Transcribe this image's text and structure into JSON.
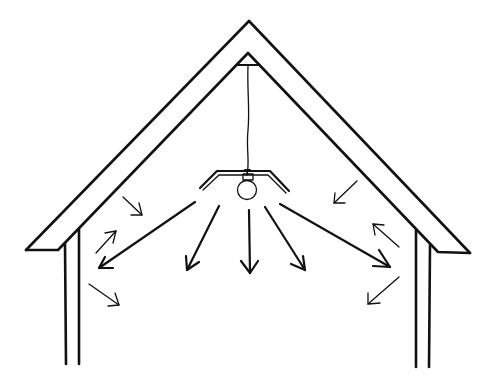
{
  "figure": {
    "description": "Line drawing of an attic cross-section with a hanging light bulb radiating arrows toward the walls and roof",
    "ink_color": "#111111",
    "background_color": "#ffffff"
  },
  "elements": {
    "roof": "roof-outline",
    "ceiling_fixture": "ceiling-mount",
    "cord": "hanging-cord",
    "lamp": "light-bulb-with-reflector",
    "walls": [
      "left-wall",
      "right-wall"
    ],
    "arrows": {
      "emitted_from_bulb": 6,
      "near_left_wall": 4,
      "near_right_wall": 3
    }
  }
}
